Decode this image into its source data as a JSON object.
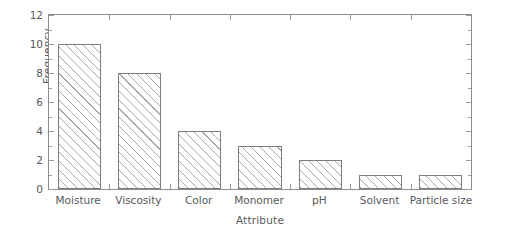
{
  "chart_data": {
    "type": "bar",
    "title": "",
    "xlabel": "Attribute",
    "ylabel": "Frequency",
    "categories": [
      "Moisture",
      "Viscosity",
      "Color",
      "Monomer",
      "pH",
      "Solvent",
      "Particle size"
    ],
    "values": [
      10,
      8,
      4,
      3,
      2,
      1,
      1
    ],
    "ylim": [
      0,
      12
    ],
    "yticks": [
      0,
      2,
      4,
      6,
      8,
      10,
      12
    ],
    "ytick_labels": [
      "0",
      "2",
      "4",
      "6",
      "8",
      "10",
      "12"
    ],
    "yminor_ticks": [
      1,
      3,
      5,
      7,
      9,
      11
    ],
    "grid": false,
    "legend": null,
    "bar_style": {
      "fill": "#ffffff",
      "hatch": "/",
      "hatch_color": "#a9a9ad",
      "edge_color": "#7d7d80"
    },
    "axis_color": "#8c8c8e",
    "text_color": "#58585a"
  }
}
